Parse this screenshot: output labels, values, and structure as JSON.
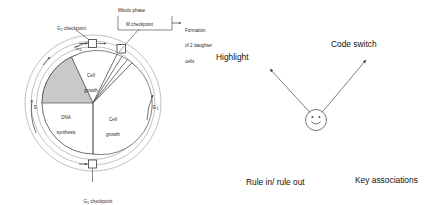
{
  "figure": {
    "title_visible": false,
    "left_diagram": {
      "name": "cell-cycle-diagram",
      "sectors": [
        {
          "key": "g2_growth",
          "label_line1": "Cell",
          "label_line2": "growth",
          "shaded": false
        },
        {
          "key": "s_phase",
          "label_line1": "DNA",
          "label_line2": "synthesis",
          "shaded": true
        },
        {
          "key": "g1_growth",
          "label_line1": "Cell",
          "label_line2": "growth",
          "shaded": false
        },
        {
          "key": "m_phase",
          "label_line1": "",
          "label_line2": "",
          "shaded": false
        }
      ],
      "ring_labels": [
        {
          "key": "g2",
          "text": "G",
          "subscript": "2"
        },
        {
          "key": "s",
          "text": "S",
          "subscript": ""
        },
        {
          "key": "g1",
          "text": "G",
          "subscript": "1"
        }
      ],
      "callouts": [
        {
          "key": "g2-checkpoint",
          "text": "G",
          "subscript": "2",
          "suffix": " checkpoint"
        },
        {
          "key": "m-checkpoint",
          "text": "M checkpoint",
          "subscript": "",
          "suffix": ""
        },
        {
          "key": "g1-checkpoint",
          "line1_text": "G",
          "line1_sub": "1",
          "line1_suffix": " checkpoint",
          "line2": "(restriction)"
        }
      ],
      "bracket_label": "Mitotic phase",
      "outcome_label_lines": [
        "Formation",
        "of 2 daughter",
        "cells"
      ]
    },
    "right_diagram": {
      "name": "study-strategy-map",
      "center_node": "smiley-face",
      "labels": [
        {
          "key": "highlight",
          "text": "Highlight"
        },
        {
          "key": "code-switch",
          "text": "Code switch"
        },
        {
          "key": "rule-in-rule-out",
          "text": "Rule in/ rule out"
        },
        {
          "key": "key-associations",
          "text": "Key associations"
        }
      ]
    }
  },
  "colors": {
    "line": "#3a3a3a",
    "shaded_sector": "#c9c9c9",
    "plain_sector": "#ffffff",
    "text": "#2b2b2b",
    "background": "#ffffff"
  }
}
